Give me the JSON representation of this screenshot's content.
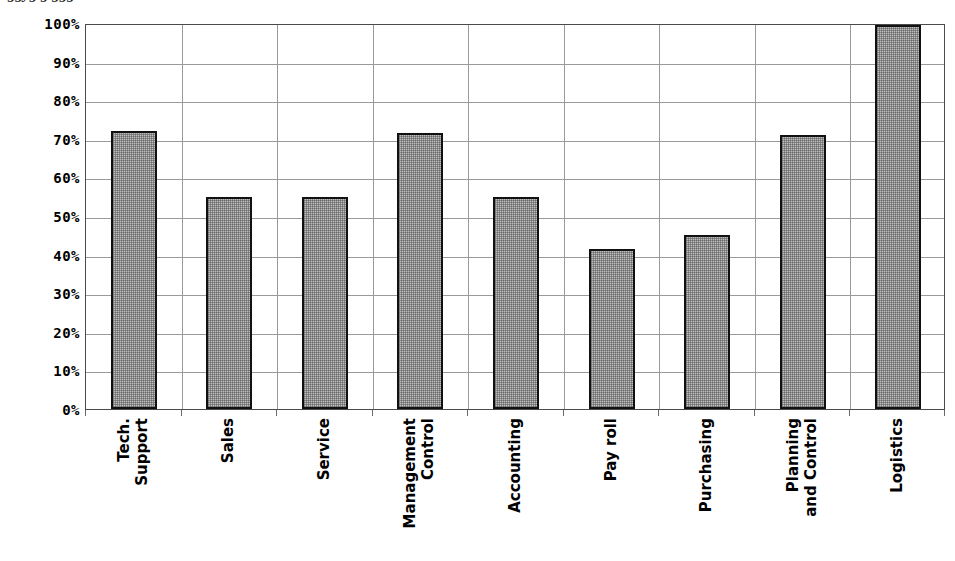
{
  "chart_data": {
    "type": "bar",
    "title": "",
    "xlabel": "",
    "ylabel": "",
    "categories": [
      "Tech. Support",
      "Sales",
      "Service",
      "Management Control",
      "Accounting",
      "Pay roll",
      "Purchasing",
      "Planning and Control",
      "Logistics"
    ],
    "category_lines": [
      [
        "Tech.",
        "Support"
      ],
      [
        "Sales"
      ],
      [
        "Service"
      ],
      [
        "Management",
        "Control"
      ],
      [
        "Accounting"
      ],
      [
        "Pay roll"
      ],
      [
        "Purchasing"
      ],
      [
        "Planning",
        "and Control"
      ],
      [
        "Logistics"
      ]
    ],
    "values": [
      72,
      55,
      55,
      71.5,
      55,
      41.5,
      45,
      71,
      99.5
    ],
    "ylim": [
      0,
      100
    ],
    "ytick_values": [
      100,
      90,
      80,
      70,
      60,
      50,
      40,
      30,
      20,
      10,
      0
    ],
    "ytick_labels": [
      "100%",
      "90%",
      "80%",
      "70%",
      "60%",
      "50%",
      "40%",
      "30%",
      "20%",
      "10%",
      "0%"
    ],
    "grid": {
      "horizontal": true,
      "vertical": true,
      "vertical_count": 8,
      "color": "#9a9a9a"
    },
    "legend": {
      "visible": false,
      "position": "none"
    },
    "series_style": {
      "fill": "#c0c0c0",
      "pattern": "dither-checker-gray",
      "border": "#111111"
    },
    "plot_frame_color": "#4a4a4a"
  },
  "figure": {
    "clipped_title_fragment": "ggyg g ggg"
  }
}
